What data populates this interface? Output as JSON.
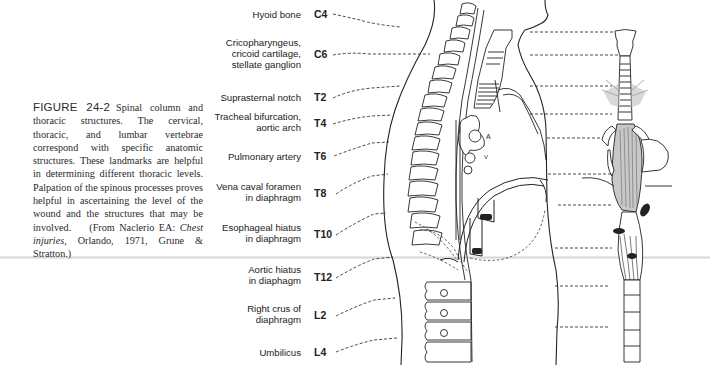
{
  "figure": {
    "label": "FIGURE 24-2",
    "caption_text": "Spinal column and thoracic structures. The cervical, thoracic, and lumbar vertebrae correspond with specific anatomic structures. These landmarks are helpful in determining different thoracic levels. Palpation of the spinous processes proves helpful in ascertaining the level of the wound and the structures that may be involved.",
    "source_prefix": "(From Naclerio EA: ",
    "source_title": "Chest injuries",
    "source_suffix": ", Orlando, 1971, Grune & Stratton.)"
  },
  "landmarks": [
    {
      "structure": "Hyoid bone",
      "level": "C4"
    },
    {
      "structure": "Cricopharyngeus, cricoid cartilage, stellate ganglion",
      "level": "C6"
    },
    {
      "structure": "Suprasternal notch",
      "level": "T2"
    },
    {
      "structure": "Tracheal bifurcation, aortic arch",
      "level": "T4"
    },
    {
      "structure": "Pulmonary artery",
      "level": "T6"
    },
    {
      "structure": "Vena caval foramen in diaphragm",
      "level": "T8"
    },
    {
      "structure": "Esophageal hiatus in diaphragm",
      "level": "T10"
    },
    {
      "structure": "Aortic hiatus in diaphagm",
      "level": "T12"
    },
    {
      "structure": "Right crus of diaphragm",
      "level": "L2"
    },
    {
      "structure": "Umbilicus",
      "level": "L4"
    }
  ],
  "labels": {
    "l0": [
      "Hyoid bone"
    ],
    "l1": [
      "Cricopharyngeus,",
      "cricoid cartilage,",
      "stellate ganglion"
    ],
    "l2": [
      "Suprasternal notch"
    ],
    "l3": [
      "Tracheal bifurcation,",
      "aortic arch"
    ],
    "l4": [
      "Pulmonary artery"
    ],
    "l5": [
      "Vena caval foramen",
      "in diaphragm"
    ],
    "l6": [
      "Esophageal hiatus",
      "in diaphragm"
    ],
    "l7": [
      "Aortic hiatus",
      "in diaphagm"
    ],
    "l8": [
      "Right crus of",
      "diaphragm"
    ],
    "l9": [
      "Umbilicus"
    ]
  },
  "illustration": {
    "heart_letters": [
      "A",
      "V"
    ]
  }
}
